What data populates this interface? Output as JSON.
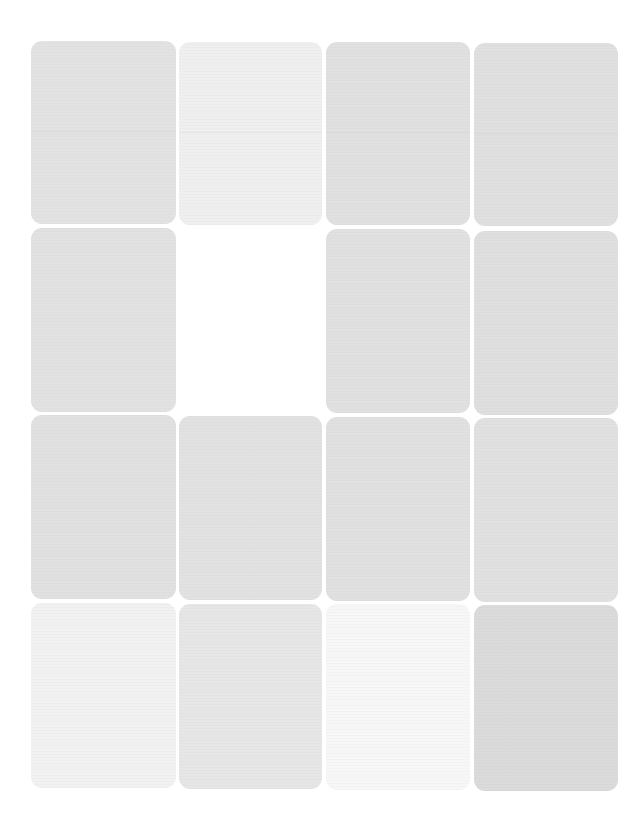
{
  "sheet": {
    "background": "#ffffff",
    "rows": 4,
    "columns": 4,
    "tiles": [
      {
        "row": 1,
        "col": 1,
        "x": 31,
        "y": 41,
        "w": 145,
        "h": 183,
        "color": "#e2e2e2",
        "empty": false
      },
      {
        "row": 1,
        "col": 2,
        "x": 179,
        "y": 42,
        "w": 143,
        "h": 183,
        "color": "#efefef",
        "empty": false
      },
      {
        "row": 1,
        "col": 3,
        "x": 326,
        "y": 42,
        "w": 144,
        "h": 183,
        "color": "#e0e0e0",
        "empty": false
      },
      {
        "row": 1,
        "col": 4,
        "x": 474,
        "y": 43,
        "w": 144,
        "h": 183,
        "color": "#dfdfdf",
        "empty": false
      },
      {
        "row": 2,
        "col": 1,
        "x": 31,
        "y": 228,
        "w": 145,
        "h": 184,
        "color": "#e1e1e1",
        "empty": false
      },
      {
        "row": 2,
        "col": 2,
        "x": 179,
        "y": 229,
        "w": 143,
        "h": 184,
        "color": "#ffffff",
        "empty": true
      },
      {
        "row": 2,
        "col": 3,
        "x": 326,
        "y": 229,
        "w": 144,
        "h": 184,
        "color": "#e0e0e0",
        "empty": false
      },
      {
        "row": 2,
        "col": 4,
        "x": 474,
        "y": 231,
        "w": 144,
        "h": 184,
        "color": "#dedede",
        "empty": false
      },
      {
        "row": 3,
        "col": 1,
        "x": 31,
        "y": 415,
        "w": 145,
        "h": 184,
        "color": "#e0e0e0",
        "empty": false
      },
      {
        "row": 3,
        "col": 2,
        "x": 179,
        "y": 416,
        "w": 143,
        "h": 184,
        "color": "#e1e1e1",
        "empty": false
      },
      {
        "row": 3,
        "col": 3,
        "x": 326,
        "y": 417,
        "w": 144,
        "h": 184,
        "color": "#e0e0e0",
        "empty": false
      },
      {
        "row": 3,
        "col": 4,
        "x": 474,
        "y": 418,
        "w": 144,
        "h": 184,
        "color": "#e0e0e0",
        "empty": false
      },
      {
        "row": 4,
        "col": 1,
        "x": 31,
        "y": 603,
        "w": 145,
        "h": 185,
        "color": "#f1f1f1",
        "empty": false
      },
      {
        "row": 4,
        "col": 2,
        "x": 179,
        "y": 604,
        "w": 143,
        "h": 185,
        "color": "#e6e6e6",
        "empty": false
      },
      {
        "row": 4,
        "col": 3,
        "x": 326,
        "y": 604,
        "w": 144,
        "h": 186,
        "color": "#f7f7f7",
        "empty": false
      },
      {
        "row": 4,
        "col": 4,
        "x": 474,
        "y": 605,
        "w": 144,
        "h": 186,
        "color": "#dadada",
        "empty": false
      }
    ]
  }
}
